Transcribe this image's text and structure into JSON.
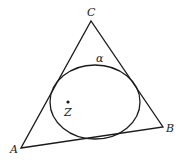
{
  "diagram": {
    "type": "triangle-with-inscribed-ellipse",
    "stroke_color": "#1a1a1a",
    "triangle": {
      "vertices": [
        {
          "name": "A",
          "label": "A",
          "x": 21,
          "y": 148,
          "label_x": 10,
          "label_y": 153
        },
        {
          "name": "B",
          "label": "B",
          "x": 163,
          "y": 127,
          "label_x": 166,
          "label_y": 132
        },
        {
          "name": "C",
          "label": "C",
          "x": 91,
          "y": 21,
          "label_x": 87,
          "label_y": 16
        }
      ]
    },
    "ellipse": {
      "label": "α",
      "cx": 95,
      "cy": 102,
      "rx": 45,
      "ry": 37,
      "label_x": 96,
      "label_y": 62
    },
    "point": {
      "label": "Z",
      "x": 68,
      "y": 102,
      "label_x": 64,
      "label_y": 116
    }
  }
}
